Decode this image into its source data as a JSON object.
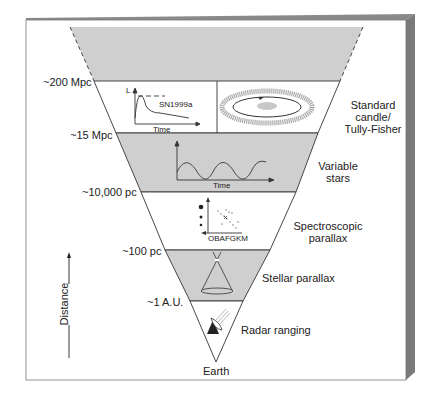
{
  "diagram": {
    "colors": {
      "panel_face": "#ffffff",
      "panel_top": "#8a8a8a",
      "panel_side": "#7a7a7a",
      "shaded_band": "#cfcfcf",
      "line": "#333333"
    },
    "distance_markers": [
      {
        "label": "~200 Mpc"
      },
      {
        "label": "~15 Mpc"
      },
      {
        "label": "~10,000 pc"
      },
      {
        "label": "~100 pc"
      },
      {
        "label": "~1 A.U."
      }
    ],
    "methods": [
      {
        "label_line1": "Standard",
        "label_line2": "candle/",
        "label_line3": "Tully-Fisher"
      },
      {
        "label_line1": "Variable",
        "label_line2": "stars"
      },
      {
        "label_line1": "Spectroscopic",
        "label_line2": "parallax"
      },
      {
        "label_line1": "Stellar parallax"
      },
      {
        "label_line1": "Radar ranging"
      }
    ],
    "insets": {
      "supernova": {
        "y_axis": "L",
        "x_axis": "Time",
        "label": "SN1999a"
      },
      "variable": {
        "x_axis": "Time"
      },
      "hr": {
        "x_axis": "OBAFGKM"
      }
    },
    "apex_label": "Earth",
    "axis_label": "Distance"
  }
}
